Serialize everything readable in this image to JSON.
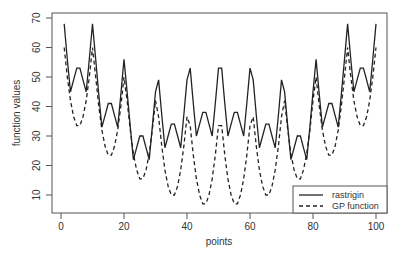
{
  "chart_data": {
    "type": "line",
    "title": "",
    "xlabel": "points",
    "ylabel": "function values",
    "xlim": [
      0,
      100
    ],
    "ylim": [
      5,
      70
    ],
    "xticks": [
      0,
      20,
      40,
      60,
      80,
      100
    ],
    "yticks": [
      10,
      20,
      30,
      40,
      50,
      60,
      70
    ],
    "grid": false,
    "legend_position": "bottom-right",
    "x": [
      1,
      2,
      3,
      4,
      5,
      6,
      7,
      8,
      9,
      10,
      11,
      12,
      13,
      14,
      15,
      16,
      17,
      18,
      19,
      20,
      21,
      22,
      23,
      24,
      25,
      26,
      27,
      28,
      29,
      30,
      31,
      32,
      33,
      34,
      35,
      36,
      37,
      38,
      39,
      40,
      41,
      42,
      43,
      44,
      45,
      46,
      47,
      48,
      49,
      50,
      51,
      52,
      53,
      54,
      55,
      56,
      57,
      58,
      59,
      60,
      61,
      62,
      63,
      64,
      65,
      66,
      67,
      68,
      69,
      70,
      71,
      72,
      73,
      74,
      75,
      76,
      77,
      78,
      79,
      80,
      81,
      82,
      83,
      84,
      85,
      86,
      87,
      88,
      89,
      90,
      91,
      92,
      93,
      94,
      95,
      96,
      97,
      98,
      99,
      100
    ],
    "series": [
      {
        "name": "rastrigin",
        "style": "solid",
        "component": [
          34,
          22,
          11,
          15,
          19,
          19,
          15,
          11,
          22,
          34
        ]
      },
      {
        "name": "GP function",
        "style": "dashed",
        "component": [
          30,
          20,
          12,
          6.5,
          3.5,
          3.5,
          6.5,
          12,
          20,
          30
        ]
      }
    ],
    "note": "value at point k=(r-1)*10+c equals component[r-1]+component[c-1] for r,c in 1..10"
  },
  "axes": {
    "xlabel": "points",
    "ylabel": "function values",
    "xtick_labels": [
      "0",
      "20",
      "40",
      "60",
      "80",
      "100"
    ],
    "ytick_labels": [
      "10",
      "20",
      "30",
      "40",
      "50",
      "60",
      "70"
    ]
  },
  "legend": {
    "items": [
      {
        "label": "rastrigin",
        "style": "solid"
      },
      {
        "label": "GP function",
        "style": "dashed"
      }
    ]
  }
}
